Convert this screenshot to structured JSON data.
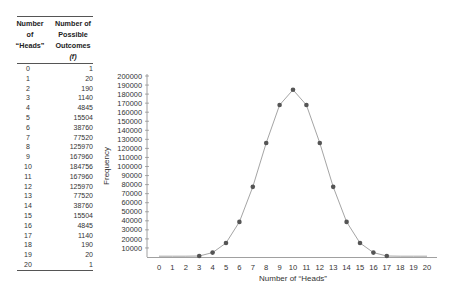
{
  "table": {
    "headers": [
      [
        "Number",
        "of",
        "“Heads”"
      ],
      [
        "Number of",
        "Possible",
        "Outcomes",
        "(f)"
      ]
    ],
    "rows": [
      {
        "heads": "0",
        "outcomes": "1"
      },
      {
        "heads": "1",
        "outcomes": "20"
      },
      {
        "heads": "2",
        "outcomes": "190"
      },
      {
        "heads": "3",
        "outcomes": "1140"
      },
      {
        "heads": "4",
        "outcomes": "4845"
      },
      {
        "heads": "5",
        "outcomes": "15504"
      },
      {
        "heads": "6",
        "outcomes": "38760"
      },
      {
        "heads": "7",
        "outcomes": "77520"
      },
      {
        "heads": "8",
        "outcomes": "125970"
      },
      {
        "heads": "9",
        "outcomes": "167960"
      },
      {
        "heads": "10",
        "outcomes": "184756"
      },
      {
        "heads": "11",
        "outcomes": "167960"
      },
      {
        "heads": "12",
        "outcomes": "125970"
      },
      {
        "heads": "13",
        "outcomes": "77520"
      },
      {
        "heads": "14",
        "outcomes": "38760"
      },
      {
        "heads": "15",
        "outcomes": "15504"
      },
      {
        "heads": "16",
        "outcomes": "4845"
      },
      {
        "heads": "17",
        "outcomes": "1140"
      },
      {
        "heads": "18",
        "outcomes": "190"
      },
      {
        "heads": "19",
        "outcomes": "20"
      },
      {
        "heads": "20",
        "outcomes": "1"
      }
    ]
  },
  "chart_data": {
    "type": "line",
    "title": "",
    "xlabel": "Number of “Heads”",
    "ylabel": "Frequency",
    "x": [
      0,
      1,
      2,
      3,
      4,
      5,
      6,
      7,
      8,
      9,
      10,
      11,
      12,
      13,
      14,
      15,
      16,
      17,
      18,
      19,
      20
    ],
    "categories": [
      "0",
      "1",
      "2",
      "3",
      "4",
      "5",
      "6",
      "7",
      "8",
      "9",
      "10",
      "11",
      "12",
      "13",
      "14",
      "15",
      "16",
      "17",
      "18",
      "19",
      "20"
    ],
    "series": [
      {
        "name": "Frequency",
        "values": [
          1,
          20,
          190,
          1140,
          4845,
          15504,
          38760,
          77520,
          125970,
          167960,
          184756,
          167960,
          125970,
          77520,
          38760,
          15504,
          4845,
          1140,
          190,
          20,
          1
        ],
        "markers_on": [
          3,
          4,
          5,
          6,
          7,
          8,
          9,
          10,
          11,
          12,
          13,
          14,
          15,
          16,
          17
        ]
      }
    ],
    "yticks": [
      10000,
      20000,
      30000,
      40000,
      50000,
      60000,
      70000,
      80000,
      90000,
      100000,
      110000,
      120000,
      130000,
      140000,
      150000,
      160000,
      170000,
      180000,
      190000,
      200000
    ],
    "ylim": [
      0,
      200000
    ],
    "xlim": [
      0,
      20
    ],
    "grid": false,
    "legend": "none",
    "colors": {
      "line": "#9a9a9a",
      "marker": "#555555",
      "axis": "#888888",
      "text": "#333333"
    }
  }
}
